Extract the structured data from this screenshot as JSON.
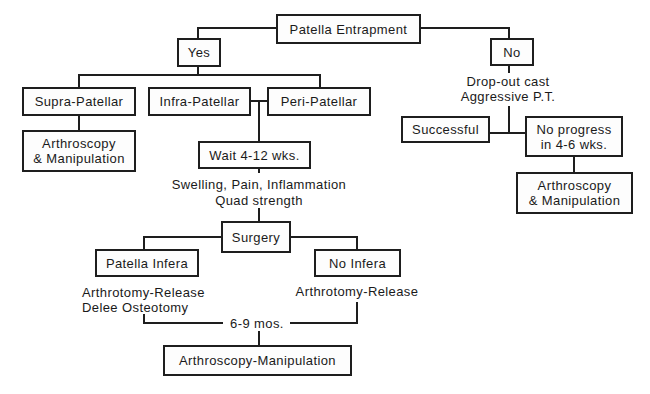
{
  "diagram": {
    "nodes": {
      "root": "Patella Entrapment",
      "yes": "Yes",
      "no": "No",
      "supra": "Supra-Patellar",
      "infra": "Infra-Patellar",
      "peri": "Peri-Patellar",
      "arthro_left": "Arthroscopy\n& Manipulation",
      "wait": "Wait 4-12 wks.",
      "surgery": "Surgery",
      "patella_infera": "Patella Infera",
      "no_infera": "No Infera",
      "successful": "Successful",
      "no_progress": "No progress\nin 4-6 wks.",
      "arthro_right": "Arthroscopy\n& Manipulation",
      "final": "Arthroscopy-Manipulation"
    },
    "labels": {
      "dropout_1": "Drop-out cast",
      "dropout_2": "Aggressive P.T.",
      "criteria_1": "Swelling, Pain, Inflammation",
      "criteria_2": "Quad strength",
      "infera_tx_1": "Arthrotomy-Release",
      "infera_tx_2": "Delee Osteotomy",
      "no_infera_tx": "Arthrotomy-Release",
      "interval": "6-9 mos."
    }
  }
}
